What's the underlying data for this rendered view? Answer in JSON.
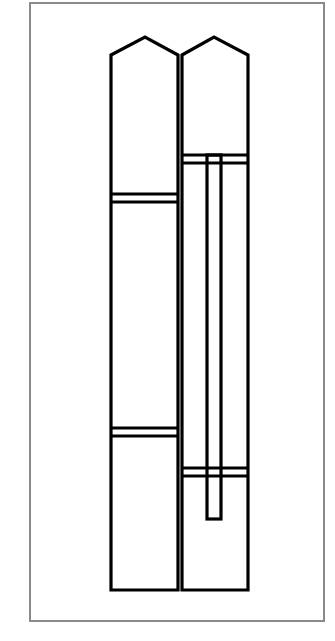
{
  "diagram": {
    "title": "",
    "colors": {
      "frame": "#8a8a8a",
      "stroke": "#000000",
      "background": "#ffffff"
    },
    "frame": {
      "x": 30,
      "y": 3,
      "w": 294,
      "h": 618
    },
    "leaves": [
      {
        "name": "left-leaf",
        "x1": 111,
        "x2": 178,
        "apex_x": 145,
        "apex_y": 37,
        "shoulder_y": 55,
        "bottom_y": 590,
        "rails": [
          {
            "y1": 194,
            "y2": 202
          },
          {
            "y1": 428,
            "y2": 436
          }
        ]
      },
      {
        "name": "right-leaf",
        "x1": 182,
        "x2": 248,
        "apex_x": 214,
        "apex_y": 37,
        "shoulder_y": 55,
        "bottom_y": 590,
        "rails": [
          {
            "y1": 155,
            "y2": 163
          },
          {
            "y1": 468,
            "y2": 476
          }
        ]
      }
    ],
    "vertical_bar": {
      "x1": 207,
      "x2": 221,
      "y1": 155,
      "y2": 519
    }
  }
}
